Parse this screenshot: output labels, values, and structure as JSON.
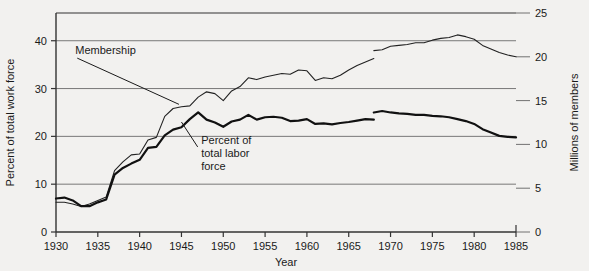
{
  "chart_data": {
    "type": "line",
    "title": "",
    "xlabel": "Year",
    "ylabel": "Percent of total work force",
    "y2label": "Millions of members",
    "xlim": [
      1930,
      1985
    ],
    "ylim": [
      0,
      45.8
    ],
    "y2lim": [
      0,
      25
    ],
    "grid": true,
    "legend_position": "inline-annotations",
    "xticks": [
      1930,
      1935,
      1940,
      1945,
      1950,
      1955,
      1960,
      1965,
      1970,
      1975,
      1980,
      1985
    ],
    "xtick_labels": [
      "1930",
      "1935",
      "1940",
      "1945",
      "1950",
      "1955",
      "1960",
      "1965",
      "1970",
      "1975",
      "1980",
      "1985"
    ],
    "yticks": [
      0,
      10,
      20,
      30,
      40
    ],
    "ytick_labels": [
      "0",
      "10",
      "20",
      "30",
      "40"
    ],
    "y2ticks": [
      0,
      5,
      10,
      15,
      20,
      25
    ],
    "y2tick_labels": [
      "0",
      "5",
      "10",
      "15",
      "20",
      "25"
    ],
    "annotations": [
      {
        "name": "membership-annotation",
        "text": "Membership",
        "lines": [
          "Membership"
        ],
        "x": 1932.3,
        "y": 37.2
      },
      {
        "name": "percent-annotation",
        "text": "Percent of total labor force",
        "lines": [
          "Percent of",
          "total labor",
          "force"
        ],
        "x": 1947.0,
        "y": 18.0
      }
    ],
    "series": [
      {
        "name": "Membership",
        "axis": "y2",
        "unit": "millions of members",
        "color": "#222222",
        "line_width": 1.1,
        "break_at": 1968,
        "x": [
          1930,
          1931,
          1932,
          1933,
          1934,
          1935,
          1936,
          1937,
          1938,
          1939,
          1940,
          1941,
          1942,
          1943,
          1944,
          1945,
          1946,
          1947,
          1948,
          1949,
          1950,
          1951,
          1952,
          1953,
          1954,
          1955,
          1956,
          1957,
          1958,
          1959,
          1960,
          1961,
          1962,
          1963,
          1964,
          1965,
          1966,
          1967,
          1968,
          1968,
          1969,
          1970,
          1971,
          1972,
          1973,
          1974,
          1975,
          1976,
          1977,
          1978,
          1979,
          1980,
          1981,
          1982,
          1983,
          1984,
          1985
        ],
        "values": [
          3.4,
          3.4,
          3.2,
          2.9,
          3.2,
          3.6,
          4.0,
          7.0,
          8.0,
          8.8,
          8.9,
          10.5,
          10.8,
          13.2,
          14.1,
          14.3,
          14.4,
          15.4,
          16.0,
          15.8,
          15.0,
          16.1,
          16.6,
          17.6,
          17.4,
          17.7,
          17.9,
          18.1,
          18.0,
          18.5,
          18.4,
          17.3,
          17.6,
          17.5,
          17.9,
          18.5,
          19.0,
          19.4,
          19.8,
          20.7,
          20.8,
          21.2,
          21.3,
          21.4,
          21.6,
          21.6,
          21.9,
          22.1,
          22.2,
          22.5,
          22.3,
          22.0,
          21.3,
          20.9,
          20.5,
          20.2,
          20.0
        ]
      },
      {
        "name": "Percent of total labor force",
        "axis": "y1",
        "unit": "percent of total work force",
        "color": "#111111",
        "line_width": 2.2,
        "break_at": 1968,
        "x": [
          1930,
          1931,
          1932,
          1933,
          1934,
          1935,
          1936,
          1937,
          1938,
          1939,
          1940,
          1941,
          1942,
          1943,
          1944,
          1945,
          1946,
          1947,
          1948,
          1949,
          1950,
          1951,
          1952,
          1953,
          1954,
          1955,
          1956,
          1957,
          1958,
          1959,
          1960,
          1961,
          1962,
          1963,
          1964,
          1965,
          1966,
          1967,
          1968,
          1968,
          1969,
          1970,
          1971,
          1972,
          1973,
          1974,
          1975,
          1976,
          1977,
          1978,
          1979,
          1980,
          1981,
          1982,
          1983,
          1984,
          1985
        ],
        "values": [
          7.0,
          7.2,
          6.6,
          5.4,
          5.4,
          6.2,
          6.8,
          12.0,
          13.4,
          14.3,
          15.1,
          17.6,
          17.8,
          20.2,
          21.4,
          21.9,
          23.6,
          25.0,
          23.5,
          22.9,
          22.0,
          23.1,
          23.5,
          24.5,
          23.5,
          24.0,
          24.1,
          23.9,
          23.2,
          23.3,
          23.6,
          22.6,
          22.7,
          22.5,
          22.8,
          23.0,
          23.3,
          23.6,
          23.5,
          25.0,
          25.3,
          25.0,
          24.8,
          24.7,
          24.5,
          24.5,
          24.3,
          24.2,
          24.0,
          23.6,
          23.2,
          22.6,
          21.5,
          20.8,
          20.1,
          19.9,
          19.8
        ]
      }
    ]
  },
  "axis_titles": {
    "left": "Percent of total work force",
    "right": "Millions of members",
    "bottom": "Year"
  },
  "colors": {
    "background": "#f2f1ef",
    "axis": "#333333",
    "grid": "#555555",
    "membership_line": "#222222",
    "percent_line": "#111111"
  }
}
